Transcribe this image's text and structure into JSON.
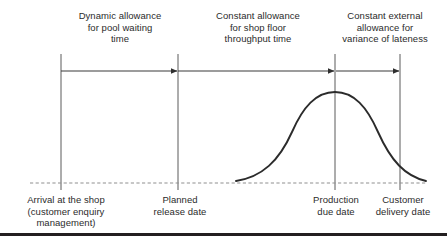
{
  "figure": {
    "colors": {
      "line": "#3a3a3a",
      "curve": "#2b2b2b",
      "dashed_baseline": "#8a8a8a",
      "text": "#2b2b2b",
      "bottom_rule": "#231f20",
      "background": "#ffffff"
    },
    "top_labels": [
      {
        "name": "dynamic-allowance-label",
        "lines": [
          "Dynamic allowance",
          "for pool waiting",
          "time"
        ],
        "center_x": 120,
        "top_y": 10
      },
      {
        "name": "shop-floor-allowance-label",
        "lines": [
          "Constant allowance",
          "for shop floor",
          "throughput time"
        ],
        "center_x": 258,
        "top_y": 10
      },
      {
        "name": "external-allowance-label",
        "lines": [
          "Constant external",
          "allowance for",
          "variance of lateness"
        ],
        "center_x": 385,
        "top_y": 10
      }
    ],
    "bottom_labels": [
      {
        "name": "arrival-at-shop-label",
        "lines": [
          "Arrival at the shop",
          "(customer enquiry",
          "management)"
        ],
        "center_x": 66,
        "top_y": 194
      },
      {
        "name": "planned-release-date-label",
        "lines": [
          "Planned",
          "release date"
        ],
        "center_x": 180,
        "top_y": 194
      },
      {
        "name": "production-due-date-label",
        "lines": [
          "Production",
          "due date"
        ],
        "center_x": 336,
        "top_y": 194
      },
      {
        "name": "customer-delivery-date-label",
        "lines": [
          "Customer",
          "delivery date"
        ],
        "center_x": 403,
        "top_y": 194
      }
    ],
    "milestones": [
      {
        "name": "arrival-at-shop",
        "x": 61
      },
      {
        "name": "planned-release-date",
        "x": 178
      },
      {
        "name": "production-due-date",
        "x": 335
      },
      {
        "name": "customer-delivery-date",
        "x": 400
      }
    ],
    "arrows": [
      {
        "name": "dynamic-allowance-arrow",
        "from_x": 61,
        "to_x": 178,
        "y": 71
      },
      {
        "name": "shop-floor-allowance-arrow",
        "from_x": 178,
        "to_x": 335,
        "y": 71
      },
      {
        "name": "external-allowance-arrow",
        "from_x": 335,
        "to_x": 400,
        "y": 71
      }
    ],
    "baseline": {
      "name": "baseline",
      "from_x": 30,
      "to_x": 426,
      "y": 183
    },
    "distribution_curve": {
      "name": "lateness-distribution-curve",
      "peak_x": 335,
      "peak_y": 92,
      "left_x": 236,
      "right_x": 426,
      "baseline_y": 183
    }
  }
}
